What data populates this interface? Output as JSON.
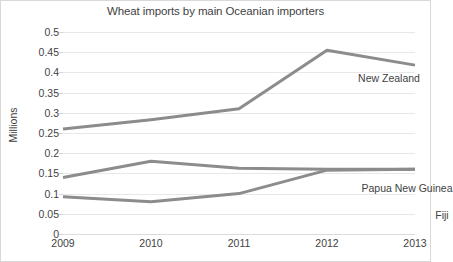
{
  "chart_data": {
    "type": "line",
    "title": "Wheat imports by main Oceanian importers",
    "xlabel": "",
    "ylabel": "Millions",
    "categories": [
      "2009",
      "2010",
      "2011",
      "2012",
      "2013"
    ],
    "x": [
      2009,
      2010,
      2011,
      2012,
      2013
    ],
    "ylim": [
      0,
      0.5
    ],
    "ytick_labels": [
      "0.5",
      "0.45",
      "0.4",
      "0.35",
      "0.3",
      "0.25",
      "0.2",
      "0.15",
      "0.1",
      "0.05",
      "0"
    ],
    "ytick_values": [
      0.5,
      0.45,
      0.4,
      0.35,
      0.3,
      0.25,
      0.2,
      0.15,
      0.1,
      0.05,
      0
    ],
    "grid": true,
    "legend_position": "inline-labels",
    "series": [
      {
        "name": "New Zealand",
        "values": [
          0.26,
          0.283,
          0.31,
          0.455,
          0.418
        ],
        "color": "#8c8c8c"
      },
      {
        "name": "Papua New Guinea",
        "values": [
          0.14,
          0.18,
          0.163,
          0.16,
          0.16
        ],
        "color": "#8c8c8c"
      },
      {
        "name": "Fiji",
        "values": [
          0.092,
          0.08,
          0.1,
          0.158,
          0.16
        ],
        "color": "#8c8c8c"
      }
    ],
    "annotations": [
      {
        "text": "New Zealand",
        "series": "New Zealand"
      },
      {
        "text": "Papua New Guinea",
        "series": "Papua New Guinea"
      },
      {
        "text": "Fiji",
        "series": "Fiji"
      }
    ],
    "colors": {
      "line": "#8c8c8c",
      "grid": "#e8e8e8",
      "text": "#3f3f3f",
      "background": "#ffffff",
      "border": "#d9d9d9"
    }
  }
}
